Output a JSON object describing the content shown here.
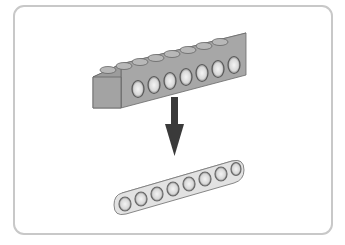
{
  "figure": {
    "top_part": {
      "name": "technic-brick-1x8",
      "hole_count": 7,
      "stud_count": 8,
      "color": "#a9a9a9"
    },
    "arrow": {
      "direction": "down",
      "color": "#3a3a3a"
    },
    "bottom_part": {
      "name": "technic-beam-7",
      "hole_count": 7,
      "color": "#e6e6e6"
    },
    "frame_border_color": "#c8c8c8"
  }
}
